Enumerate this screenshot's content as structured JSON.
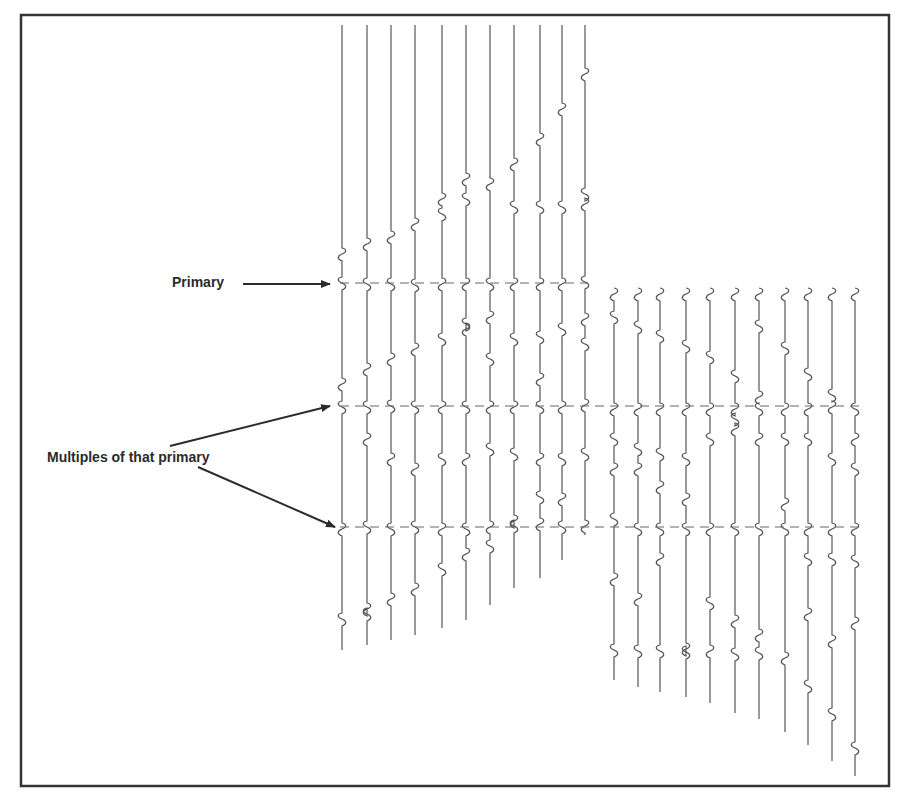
{
  "figure": {
    "frame": {
      "x": 21,
      "y": 15,
      "width": 868,
      "height": 771,
      "stroke": "#333333"
    },
    "labels": {
      "primary": "Primary",
      "multiples": "Multiples of that primary"
    },
    "colors": {
      "trace": "#555555",
      "dash": "#666666",
      "arrow": "#2b2b2b",
      "text": "#2b2b2b"
    },
    "left_gather": {
      "trace_x": [
        342,
        367,
        391,
        415,
        442,
        466,
        490,
        514,
        540,
        562,
        585
      ],
      "top": 25,
      "bottoms": [
        650,
        645,
        640,
        635,
        628,
        620,
        605,
        588,
        578,
        560,
        535
      ],
      "wiggles": [
        [
          255,
          284,
          385,
          408,
          530,
          620
        ],
        [
          245,
          285,
          370,
          408,
          440,
          528,
          610,
          615
        ],
        [
          238,
          285,
          360,
          407,
          460,
          530,
          600
        ],
        [
          225,
          286,
          350,
          408,
          470,
          528,
          590
        ],
        [
          215,
          200,
          285,
          340,
          408,
          460,
          530,
          570
        ],
        [
          200,
          180,
          285,
          325,
          330,
          408,
          460,
          530,
          555
        ],
        [
          185,
          285,
          318,
          360,
          408,
          450,
          528,
          547
        ],
        [
          165,
          208,
          285,
          340,
          408,
          455,
          527,
          522
        ],
        [
          140,
          208,
          285,
          338,
          380,
          408,
          460,
          525,
          498
        ],
        [
          110,
          208,
          285,
          330,
          408,
          460,
          528,
          500
        ],
        [
          75,
          195,
          205,
          283,
          320,
          345,
          406,
          455,
          527
        ]
      ]
    },
    "right_gather": {
      "trace_x": [
        614,
        638,
        660,
        686,
        710,
        735,
        759,
        785,
        808,
        832,
        855
      ],
      "top": 288,
      "bottoms": [
        680,
        687,
        692,
        697,
        703,
        713,
        719,
        732,
        745,
        761,
        776
      ],
      "wiggles": [
        [
          295,
          318,
          410,
          440,
          470,
          520,
          580,
          651
        ],
        [
          295,
          328,
          410,
          450,
          470,
          530,
          600,
          652
        ],
        [
          295,
          337,
          410,
          455,
          488,
          530,
          560,
          652
        ],
        [
          295,
          347,
          410,
          460,
          500,
          530,
          650,
          653
        ],
        [
          295,
          358,
          410,
          440,
          530,
          604,
          652
        ],
        [
          295,
          377,
          410,
          420,
          430,
          530,
          622,
          655
        ],
        [
          295,
          327,
          398,
          410,
          440,
          530,
          636,
          654
        ],
        [
          295,
          349,
          410,
          440,
          505,
          530,
          659
        ],
        [
          295,
          375,
          410,
          440,
          530,
          560,
          615,
          687
        ],
        [
          295,
          396,
          408,
          460,
          530,
          560,
          642,
          715
        ],
        [
          295,
          410,
          440,
          470,
          530,
          562,
          624,
          749
        ]
      ]
    },
    "reflections": {
      "primary_y": 283,
      "multiple_1_y": 406,
      "multiple_2_y": 527
    }
  }
}
